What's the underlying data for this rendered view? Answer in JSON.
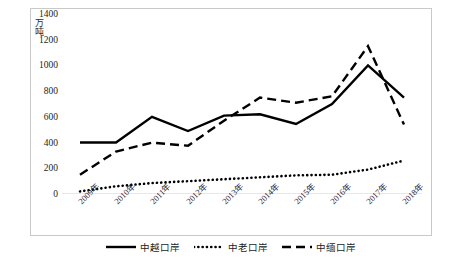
{
  "chart_data": {
    "type": "line",
    "title": "",
    "xlabel": "",
    "ylabel": "万吨",
    "ylim": [
      0,
      1400
    ],
    "ytick_step": 200,
    "yticks": [
      "1400",
      "1200",
      "1000",
      "800",
      "600",
      "400",
      "200",
      "0"
    ],
    "grid": false,
    "legend_position": "bottom",
    "categories": [
      "2009年",
      "2010年",
      "2011年",
      "2012年",
      "2013年",
      "2014年",
      "2015年",
      "2016年",
      "2017年",
      "2018年"
    ],
    "series": [
      {
        "name": "中越口岸",
        "style": "solid",
        "color": "#000000",
        "values": [
          400,
          400,
          600,
          490,
          610,
          620,
          545,
          700,
          1000,
          750
        ]
      },
      {
        "name": "中老口岸",
        "style": "dotted",
        "color": "#000000",
        "values": [
          20,
          60,
          85,
          100,
          115,
          130,
          145,
          150,
          190,
          260
        ]
      },
      {
        "name": "中缅口岸",
        "style": "dashed",
        "color": "#000000",
        "values": [
          150,
          330,
          400,
          375,
          570,
          750,
          710,
          760,
          1150,
          540
        ]
      }
    ]
  },
  "legend": {
    "items": [
      {
        "label": "中越口岸",
        "marker": "solid-line-marker"
      },
      {
        "label": "中老口岸",
        "marker": "dotted-line-marker"
      },
      {
        "label": "中缅口岸",
        "marker": "dashed-line-marker"
      }
    ]
  },
  "axis": {
    "y_label_text": "万吨"
  }
}
